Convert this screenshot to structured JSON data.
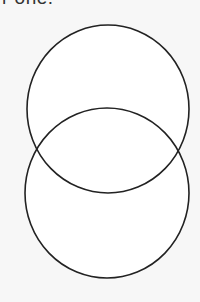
{
  "caption": {
    "text": "r one."
  },
  "diagram": {
    "type": "two-overlapping-circles",
    "stroke_color": "#222222",
    "fill_color": "#ffffff",
    "background": "#f7f7f7",
    "circles": [
      {
        "name": "top-circle",
        "cx": 108,
        "cy": 109,
        "rx": 81,
        "ry": 84
      },
      {
        "name": "bottom-circle",
        "cx": 107,
        "cy": 193,
        "rx": 82,
        "ry": 85
      }
    ]
  }
}
